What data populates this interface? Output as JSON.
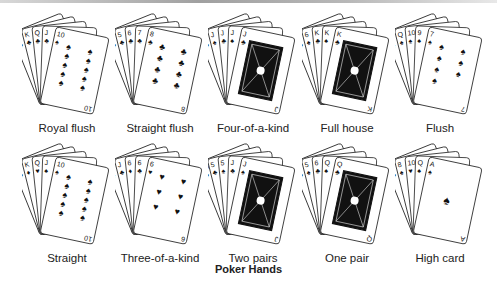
{
  "figure": {
    "title": "Poker Hands"
  },
  "hands": [
    {
      "name": "Royal flush",
      "cards": [
        "A♣",
        "K♣",
        "Q♣",
        "J♣",
        "10♠"
      ],
      "front": {
        "rank": "10",
        "suit": "♠",
        "type": "pips",
        "count": 10
      }
    },
    {
      "name": "Straight flush",
      "cards": [
        "4♣",
        "5♣",
        "6♣",
        "7♣",
        "8♣"
      ],
      "front": {
        "rank": "8",
        "suit": "♣",
        "type": "pips",
        "count": 8
      }
    },
    {
      "name": "Four-of-a-kind",
      "cards": [
        "5♣",
        "J♠",
        "J♣",
        "J♠",
        "J♣"
      ],
      "front": {
        "rank": "J",
        "suit": "♣",
        "type": "face"
      }
    },
    {
      "name": "Full house",
      "cards": [
        "6♣",
        "6♠",
        "K♣",
        "K♠",
        "K♣"
      ],
      "front": {
        "rank": "K",
        "suit": "♣",
        "type": "face"
      }
    },
    {
      "name": "Flush",
      "cards": [
        "A♠",
        "Q♠",
        "10♠",
        "9♠",
        "7♠"
      ],
      "front": {
        "rank": "7",
        "suit": "♠",
        "type": "pips",
        "count": 7
      }
    },
    {
      "name": "Straight",
      "cards": [
        "A♣",
        "K♦",
        "Q♥",
        "J♠",
        "10♠"
      ],
      "front": {
        "rank": "10",
        "suit": "♠",
        "type": "pips",
        "count": 10
      }
    },
    {
      "name": "Three-of-a-kind",
      "cards": [
        "5♠",
        "J♣",
        "6♦",
        "6♣",
        "6♥"
      ],
      "front": {
        "rank": "6",
        "suit": "♥",
        "type": "pips",
        "count": 6
      }
    },
    {
      "name": "Two pairs",
      "cards": [
        "10♣",
        "5♣",
        "5♠",
        "J♣",
        "J♠"
      ],
      "front": {
        "rank": "J",
        "suit": "♠",
        "type": "face"
      }
    },
    {
      "name": "One pair",
      "cards": [
        "3♣",
        "5♠",
        "6♣",
        "Q♠",
        "Q♣"
      ],
      "front": {
        "rank": "Q",
        "suit": "♣",
        "type": "face"
      }
    },
    {
      "name": "High card",
      "cards": [
        "3♣",
        "8♠",
        "10♥",
        "Q♠",
        "A♠"
      ],
      "front": {
        "rank": "A",
        "suit": "♠",
        "type": "ace"
      }
    }
  ]
}
